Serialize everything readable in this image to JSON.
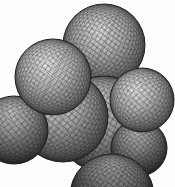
{
  "figure": {
    "type": "molecular-model",
    "canvas": {
      "width": 175,
      "height": 187
    },
    "background_color": "#fdfdfd",
    "mesh": {
      "line_color": "#151515",
      "line_opacity": 0.58,
      "outline_color": "#1d1d1d",
      "outline_width": 1.0,
      "tilt_deg": 30,
      "skew_deg": 14
    },
    "gradient_offsets": [
      "0%",
      "42%",
      "75%",
      "100%"
    ],
    "spheres": [
      {
        "name": "top",
        "cx": 104,
        "cy": 45,
        "r": 41,
        "rot": 38,
        "step_deg": 6.5,
        "stroke_width": 0.42,
        "fx": 0.44,
        "fy": 0.32,
        "colors": [
          "#dedede",
          "#a9a9a9",
          "#6f6f6f",
          "#3f3f3f"
        ]
      },
      {
        "name": "central-right",
        "cx": 104,
        "cy": 124,
        "r": 48,
        "rot": 34,
        "step_deg": 6.5,
        "stroke_width": 0.42,
        "fx": 0.4,
        "fy": 0.27,
        "colors": [
          "#cfcfcf",
          "#9b9b9b",
          "#626262",
          "#333333"
        ]
      },
      {
        "name": "bottom-right",
        "cx": 139,
        "cy": 148,
        "r": 28,
        "rot": 46,
        "step_deg": 8.5,
        "stroke_width": 0.38,
        "fx": 0.45,
        "fy": 0.22,
        "colors": [
          "#b9b9b9",
          "#868686",
          "#525252",
          "#282828"
        ]
      },
      {
        "name": "bottom",
        "cx": 112,
        "cy": 196,
        "r": 42,
        "rot": 40,
        "step_deg": 6.5,
        "stroke_width": 0.42,
        "fx": 0.5,
        "fy": 0.06,
        "colors": [
          "#adadad",
          "#787878",
          "#454545",
          "#1f1f1f"
        ]
      },
      {
        "name": "central-left",
        "cx": 63,
        "cy": 117,
        "r": 45,
        "rot": 42,
        "step_deg": 6.5,
        "stroke_width": 0.42,
        "fx": 0.42,
        "fy": 0.3,
        "colors": [
          "#d7d7d7",
          "#a3a3a3",
          "#686868",
          "#373737"
        ]
      },
      {
        "name": "left",
        "cx": 14,
        "cy": 130,
        "r": 34,
        "rot": 48,
        "step_deg": 8.5,
        "stroke_width": 0.38,
        "fx": 0.46,
        "fy": 0.24,
        "colors": [
          "#c1c1c1",
          "#8c8c8c",
          "#575757",
          "#2b2b2b"
        ]
      },
      {
        "name": "right",
        "cx": 142,
        "cy": 100,
        "r": 32,
        "rot": 44,
        "step_deg": 8.5,
        "stroke_width": 0.38,
        "fx": 0.4,
        "fy": 0.33,
        "colors": [
          "#e2e2e2",
          "#aeaeae",
          "#747474",
          "#444444"
        ]
      },
      {
        "name": "upper-left",
        "cx": 53,
        "cy": 77,
        "r": 38,
        "rot": 41,
        "step_deg": 7.0,
        "stroke_width": 0.4,
        "fx": 0.42,
        "fy": 0.32,
        "colors": [
          "#e7e7e7",
          "#b5b5b5",
          "#7a7a7a",
          "#474747"
        ]
      }
    ]
  }
}
